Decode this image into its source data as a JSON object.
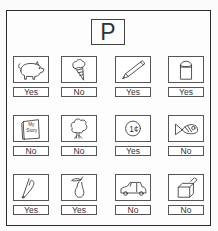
{
  "worksheet": {
    "letter": "P",
    "items": [
      {
        "picture": "pig",
        "answer": "Yes"
      },
      {
        "picture": "ice-cream-cone",
        "answer": "No"
      },
      {
        "picture": "pencil",
        "answer": "Yes"
      },
      {
        "picture": "paint-can",
        "answer": "Yes"
      },
      {
        "picture": "book",
        "answer": "No",
        "book_text_line1": "My",
        "book_text_line2": "Story"
      },
      {
        "picture": "tree",
        "answer": "No"
      },
      {
        "picture": "penny",
        "answer": "Yes",
        "coin_text": "1¢"
      },
      {
        "picture": "fish",
        "answer": "No"
      },
      {
        "picture": "safety-pin",
        "answer": "Yes"
      },
      {
        "picture": "pear",
        "answer": "Yes"
      },
      {
        "picture": "car",
        "answer": "No"
      },
      {
        "picture": "box",
        "answer": "No"
      }
    ]
  }
}
